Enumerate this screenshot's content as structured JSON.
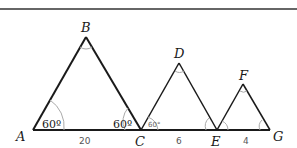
{
  "figure": {
    "vertices": {
      "A": "A",
      "B": "B",
      "C": "C",
      "D": "D",
      "E": "E",
      "F": "F",
      "G": "G"
    },
    "angle_labels": {
      "A": "60º",
      "C_in_ABC": "60º",
      "C_in_CDE": "60°"
    },
    "side_labels": {
      "AC": "20",
      "CE": "6",
      "EG": "4"
    },
    "colors": {
      "lines": "#1a1a1a",
      "arcs": "#999999",
      "top_rule": "#333333"
    }
  }
}
